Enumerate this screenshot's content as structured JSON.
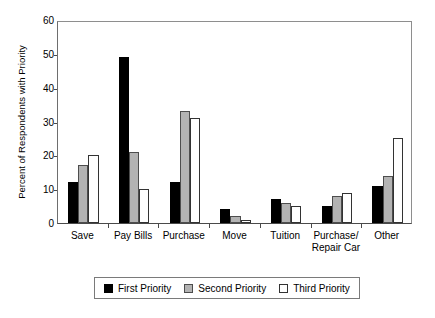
{
  "chart_data": {
    "type": "bar",
    "title": "",
    "xlabel": "",
    "ylabel": "Percent of Respondents with Priority",
    "ylim": [
      0,
      60
    ],
    "yticks": [
      0,
      10,
      20,
      30,
      40,
      50,
      60
    ],
    "grid": false,
    "legend_position": "bottom",
    "categories": [
      "Save",
      "Pay Bills",
      "Purchase",
      "Move",
      "Tuition",
      "Purchase/\nRepair Car",
      "Other"
    ],
    "series": [
      {
        "name": "First Priority",
        "color": "#000000",
        "values": [
          12,
          49,
          12,
          4,
          7,
          5,
          11
        ]
      },
      {
        "name": "Second Priority",
        "color": "#b3b3b3",
        "values": [
          17,
          21,
          33,
          2,
          6,
          8,
          14
        ]
      },
      {
        "name": "Third Priority",
        "color": "#ffffff",
        "values": [
          20,
          10,
          31,
          1,
          5,
          9,
          25
        ]
      }
    ]
  },
  "legend": {
    "items": [
      {
        "label": "First Priority"
      },
      {
        "label": "Second Priority"
      },
      {
        "label": "Third Priority"
      }
    ]
  }
}
